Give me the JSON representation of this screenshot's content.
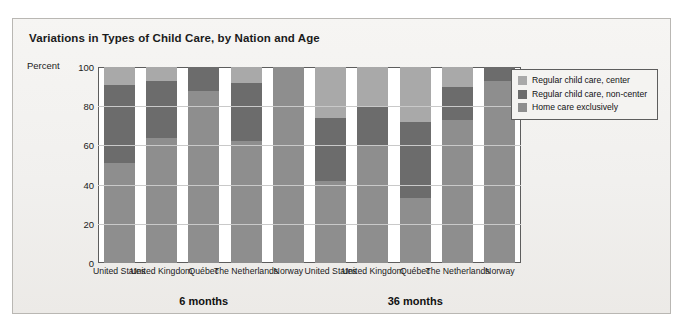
{
  "figure": {
    "title": "Variations in Types of Child Care, by Nation and Age",
    "percent_label": "Percent"
  },
  "legend": {
    "items": [
      {
        "label": "Regular child care, center",
        "color": "#a9a9a9"
      },
      {
        "label": "Regular child care, non-center",
        "color": "#6c6c6c"
      },
      {
        "label": "Home care exclusively",
        "color": "#8e8e8e"
      }
    ]
  },
  "chart_data": {
    "type": "bar",
    "stacked": true,
    "title": "Variations in Types of Child Care, by Nation and Age",
    "xlabel": "",
    "ylabel": "Percent",
    "ylim": [
      0,
      100
    ],
    "yticks": [
      0,
      20,
      40,
      60,
      80,
      100
    ],
    "grid": true,
    "legend_position": "right",
    "groups": [
      "6 months",
      "36 months"
    ],
    "categories": [
      "United States",
      "United Kingdom",
      "Québec",
      "The Netherlands",
      "Norway"
    ],
    "series": [
      {
        "name": "Regular child care, center",
        "color": "#a9a9a9",
        "values_6_months": [
          9,
          7,
          0,
          8,
          0
        ],
        "values_36_months": [
          26,
          20,
          28,
          10,
          0
        ]
      },
      {
        "name": "Regular child care, non-center",
        "color": "#6c6c6c",
        "values_6_months": [
          40,
          29,
          12,
          30,
          0
        ],
        "values_36_months": [
          32,
          20,
          39,
          17,
          7
        ]
      },
      {
        "name": "Home care exclusively",
        "color": "#8e8e8e",
        "values_6_months": [
          51,
          64,
          88,
          62,
          100
        ],
        "values_36_months": [
          42,
          60,
          33,
          73,
          93
        ]
      }
    ]
  }
}
